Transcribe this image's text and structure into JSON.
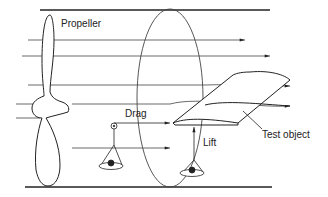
{
  "diagram": {
    "labels": {
      "propeller": "Propeller",
      "drag": "Drag",
      "lift": "Lift",
      "test_object": "Test object"
    },
    "colors": {
      "stroke": "#222222",
      "background": "#ffffff"
    }
  }
}
